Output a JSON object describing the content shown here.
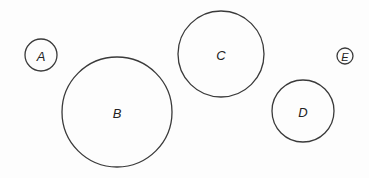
{
  "diagram": {
    "stroke_color": "#3a3a3a",
    "label_color": "#222222",
    "circles": [
      {
        "label": "A",
        "cx": 41,
        "cy": 55,
        "r": 16,
        "font_size": 13
      },
      {
        "label": "B",
        "cx": 117,
        "cy": 112,
        "r": 55,
        "font_size": 13
      },
      {
        "label": "C",
        "cx": 221,
        "cy": 54,
        "r": 43,
        "font_size": 13
      },
      {
        "label": "D",
        "cx": 303,
        "cy": 111,
        "r": 31,
        "font_size": 13
      },
      {
        "label": "E",
        "cx": 345,
        "cy": 56,
        "r": 8,
        "font_size": 11
      }
    ]
  }
}
